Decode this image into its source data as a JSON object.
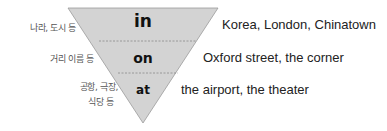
{
  "colors": {
    "triangle_fill": "#d3d3d3",
    "triangle_stroke": "#9a9a9a",
    "divider": "#8a8a8a",
    "text": "#222222",
    "label_text": "#555555"
  },
  "levels": [
    {
      "preposition": "in",
      "category": "나라, 도시 등",
      "examples": "Korea, London, Chinatown"
    },
    {
      "preposition": "on",
      "category": "거리 이름 등",
      "examples": "Oxford street, the corner"
    },
    {
      "preposition": "at",
      "category_line1": "공항, 극장,",
      "category_line2": "식당 등",
      "examples": "the airport, the theater"
    }
  ]
}
